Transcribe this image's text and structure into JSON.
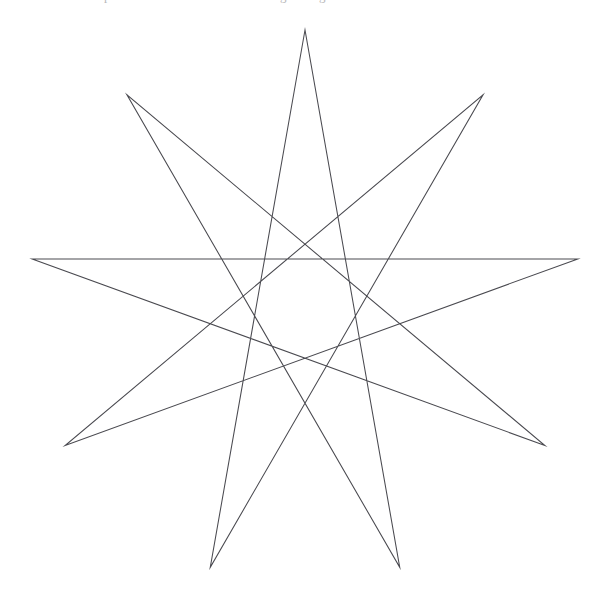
{
  "page": {
    "width": 607,
    "height": 615,
    "background_color": "#ffffff",
    "media": "scanned-book-figure"
  },
  "figure": {
    "name": "nonagram",
    "stroke_color": "#4a4a50",
    "stroke_width": 1.05,
    "fill": "none",
    "center": {
      "x": 305,
      "y": 307
    },
    "circumradius": 277,
    "points": 9,
    "step": 4,
    "start_angle_deg": 90,
    "angle_step_deg": 40,
    "closed": true,
    "vertices": [
      {
        "label": "top",
        "angle_deg": 90,
        "x": 305,
        "y": 31
      },
      {
        "label": "upper-left",
        "angle_deg": 130,
        "x": 127,
        "y": 95
      },
      {
        "label": "left",
        "angle_deg": 170,
        "x": 32,
        "y": 259
      },
      {
        "label": "lower-left",
        "angle_deg": 210,
        "x": 65,
        "y": 446
      },
      {
        "label": "bottom-left",
        "angle_deg": 250,
        "x": 210,
        "y": 567
      },
      {
        "label": "bottom-right",
        "angle_deg": 290,
        "x": 400,
        "y": 567
      },
      {
        "label": "lower-right",
        "angle_deg": 330,
        "x": 545,
        "y": 446
      },
      {
        "label": "right",
        "angle_deg": 10,
        "x": 578,
        "y": 259
      },
      {
        "label": "upper-right",
        "angle_deg": 50,
        "x": 483,
        "y": 95
      }
    ],
    "path_order": [
      0,
      4,
      8,
      3,
      7,
      2,
      6,
      1,
      5
    ],
    "notable_features": [
      "horizontal chord spanning the full width at y = 268",
      "nine sharp points of equal angular spacing",
      "central nonagonal void formed by the crossings"
    ]
  },
  "scan_artifacts": {
    "present": true,
    "note": "faint descenders of cut-off text along the top edge",
    "glyphs": [
      "p",
      "g",
      "g",
      "."
    ]
  }
}
